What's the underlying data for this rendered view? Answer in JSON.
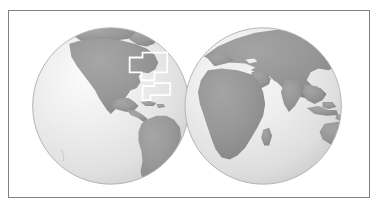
{
  "figure": {
    "title": "World map with two hemispheres",
    "caption": "",
    "frame_color": "#808080",
    "background_color": "#ffffff"
  },
  "map": {
    "projection": "orthographic",
    "type": "two-hemisphere-globe-pair",
    "ocean_color": "#e8e8e8",
    "land_color": "#9a9a9a",
    "land_color_dark": "#8d8d8d",
    "globe_outline_color": "#b0b0b0",
    "highlight_outline_color": "#ffffff",
    "highlight_outline_width": 1.6,
    "hemispheres": [
      {
        "name": "western-hemisphere",
        "label": "Western Hemisphere",
        "center_x": 110,
        "center_y": 96,
        "radius": 78,
        "continents": [
          "North America",
          "South America",
          "Greenland",
          "Antarctica"
        ]
      },
      {
        "name": "eastern-hemisphere",
        "label": "Eastern Hemisphere",
        "center_x": 265,
        "center_y": 96,
        "radius": 78,
        "continents": [
          "Africa",
          "Europe",
          "Asia",
          "Australia",
          "Antarctica"
        ]
      }
    ],
    "highlight_regions": [
      {
        "name": "highlight-region-north-america",
        "label": "North America study area",
        "shape": "stepped-rectangle"
      },
      {
        "name": "highlight-region-caribbean",
        "label": "Caribbean study area",
        "shape": "stepped-rectangle"
      }
    ]
  }
}
